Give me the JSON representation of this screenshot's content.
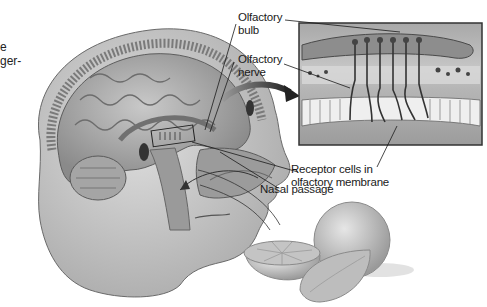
{
  "figure": {
    "partial_margin_text": [
      "e",
      "ger-"
    ],
    "labels": {
      "olfactory_bulb": [
        "Olfactory",
        "bulb"
      ],
      "olfactory_nerve": [
        "Olfactory",
        "nerve"
      ],
      "receptor_cells": [
        "Receptor cells in",
        "olfactory membrane"
      ],
      "nasal_passage": "Nasal passage"
    },
    "inset": {
      "description": "Magnified view of olfactory receptor cells beneath the olfactory bulb",
      "receptor_count": 6
    },
    "illustrated_objects": [
      "human head sagittal section",
      "brain",
      "nasal cavity",
      "whole orange",
      "halved orange",
      "orange wedge"
    ]
  },
  "colors": {
    "background": "#ffffff",
    "ink": "#1a1a1a",
    "tissue_light": "#bdbdbd",
    "tissue_mid": "#8f8f8f",
    "tissue_dark": "#555555",
    "arrow": "#333333"
  }
}
